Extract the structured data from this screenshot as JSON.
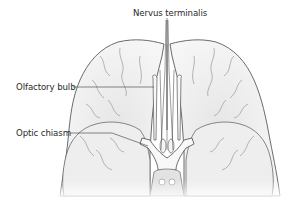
{
  "figure": {
    "labels": [
      {
        "id": "nervus-terminalis",
        "text": "Nervus terminalis"
      },
      {
        "id": "olfactory-bulb",
        "text": "Olfactory bulb"
      },
      {
        "id": "optic-chiasm",
        "text": "Optic chiasm"
      }
    ]
  },
  "colors": {
    "background": "#ffffff",
    "outline": "#5a5a5a",
    "fill_light": "#f2f2f2",
    "fill_shade": "#dcdcdc",
    "label_text": "#2a2a2a",
    "leader_line": "#3a3a3a"
  }
}
